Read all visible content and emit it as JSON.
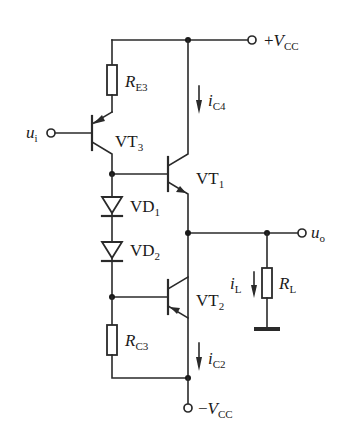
{
  "diagram": {
    "type": "circuit-schematic",
    "terminals": {
      "vcc_pos": {
        "sign": "+",
        "symbol": "V",
        "sub": "CC"
      },
      "vcc_neg": {
        "sign": "−",
        "symbol": "V",
        "sub": "CC"
      },
      "input": {
        "symbol": "u",
        "sub": "i"
      },
      "output": {
        "symbol": "u",
        "sub": "o"
      }
    },
    "resistors": {
      "re3": {
        "symbol": "R",
        "sub": "E3"
      },
      "rc3": {
        "symbol": "R",
        "sub": "C3"
      },
      "rl": {
        "symbol": "R",
        "sub": "L"
      }
    },
    "transistors": {
      "vt3": {
        "symbol": "VT",
        "sub": "3",
        "type": "PNP"
      },
      "vt1": {
        "symbol": "VT",
        "sub": "1",
        "type": "NPN"
      },
      "vt2": {
        "symbol": "VT",
        "sub": "2",
        "type": "PNP"
      }
    },
    "diodes": {
      "vd1": {
        "symbol": "VD",
        "sub": "1"
      },
      "vd2": {
        "symbol": "VD",
        "sub": "2"
      }
    },
    "currents": {
      "ic4": {
        "symbol": "i",
        "sub": "C4"
      },
      "ic2": {
        "symbol": "i",
        "sub": "C2"
      },
      "il": {
        "symbol": "i",
        "sub": "L"
      }
    },
    "colors": {
      "line": "#2a2a2a",
      "background": "#ffffff"
    }
  }
}
